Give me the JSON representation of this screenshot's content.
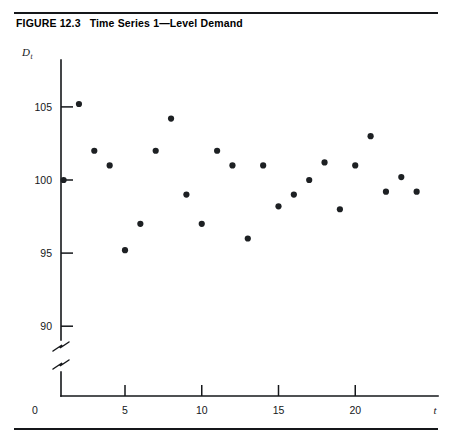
{
  "figure": {
    "label": "FIGURE 12.3",
    "title": "Time Series 1—Level Demand"
  },
  "chart_data": {
    "type": "scatter",
    "title": "Time Series 1—Level Demand",
    "xlabel": "t",
    "ylabel": "D",
    "ylabel_subscript": "t",
    "x": [
      1,
      2,
      3,
      4,
      5,
      6,
      7,
      8,
      9,
      10,
      11,
      12,
      13,
      14,
      15,
      16,
      17,
      18,
      19,
      20,
      21,
      22,
      23,
      24
    ],
    "values": [
      100,
      105.2,
      102,
      101,
      95.2,
      97,
      102,
      104.2,
      99,
      97,
      102,
      101,
      96,
      101,
      98.2,
      99,
      100,
      101.2,
      98,
      101,
      103,
      99.2,
      100.2,
      99.2
    ],
    "xlim": [
      0,
      25
    ],
    "ylim": [
      88.5,
      107
    ],
    "xticks": [
      0,
      5,
      10,
      15,
      20
    ],
    "xtick_labels": [
      "0",
      "5",
      "10",
      "15",
      "20"
    ],
    "yticks": [
      90,
      95,
      100,
      105
    ],
    "ytick_labels": [
      "90",
      "95",
      "100",
      "105"
    ],
    "axis_break": true,
    "axis_break_note": "y-axis broken below 90",
    "grid": false,
    "legend": false,
    "marker": "filled-circle",
    "marker_color": "#1d2023"
  },
  "colors": {
    "ink": "#15171a",
    "marker": "#1d2023",
    "background": "#ffffff"
  }
}
